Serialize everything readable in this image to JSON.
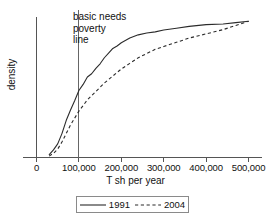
{
  "chart_data": {
    "type": "line",
    "title": "",
    "xlabel": "T sh per year",
    "ylabel": "density",
    "xlim": [
      0,
      520000
    ],
    "ylim": [
      0,
      1
    ],
    "grid": false,
    "legend_position": "bottom",
    "xticks": [
      0,
      100000,
      200000,
      300000,
      400000,
      500000
    ],
    "xtick_labels": [
      "0",
      "100,000",
      "200,000",
      "300,000",
      "400,000",
      "500,000"
    ],
    "ytick_labels": [],
    "annotations": [
      {
        "name": "basic-needs-poverty-line",
        "text_lines": [
          "basic needs",
          "poverty",
          "line"
        ],
        "x": 100000,
        "type": "vertical-reference-line"
      }
    ],
    "series": [
      {
        "name": "1991",
        "style": "solid",
        "color": "#2b2b2b",
        "x": [
          30000,
          40000,
          50000,
          60000,
          70000,
          80000,
          90000,
          100000,
          110000,
          120000,
          130000,
          140000,
          150000,
          160000,
          170000,
          180000,
          190000,
          200000,
          220000,
          240000,
          260000,
          280000,
          300000,
          330000,
          360000,
          400000,
          440000,
          470000,
          500000
        ],
        "values": [
          0.02,
          0.06,
          0.1,
          0.17,
          0.26,
          0.33,
          0.41,
          0.48,
          0.52,
          0.57,
          0.59,
          0.64,
          0.67,
          0.71,
          0.74,
          0.77,
          0.8,
          0.82,
          0.85,
          0.87,
          0.88,
          0.9,
          0.91,
          0.92,
          0.93,
          0.94,
          0.95,
          0.96,
          0.97
        ]
      },
      {
        "name": "2004",
        "style": "dashed",
        "color": "#2b2b2b",
        "x": [
          30000,
          40000,
          50000,
          60000,
          70000,
          80000,
          90000,
          100000,
          110000,
          120000,
          140000,
          160000,
          180000,
          200000,
          220000,
          240000,
          260000,
          280000,
          300000,
          330000,
          360000,
          400000,
          440000,
          470000,
          500000
        ],
        "values": [
          0.01,
          0.03,
          0.06,
          0.11,
          0.17,
          0.23,
          0.28,
          0.33,
          0.37,
          0.41,
          0.47,
          0.53,
          0.58,
          0.63,
          0.67,
          0.71,
          0.74,
          0.77,
          0.79,
          0.82,
          0.85,
          0.88,
          0.91,
          0.94,
          0.97
        ]
      }
    ]
  },
  "legend": {
    "entries": [
      {
        "label": "1991",
        "style": "solid"
      },
      {
        "label": "2004",
        "style": "dashed"
      }
    ]
  }
}
